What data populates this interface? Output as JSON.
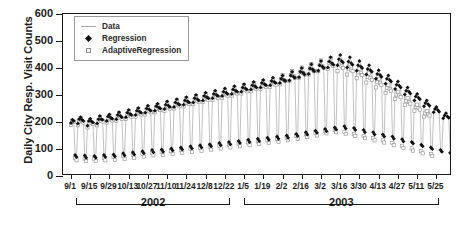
{
  "chart_data": {
    "type": "line",
    "title": "",
    "xlabel": "",
    "ylabel": "Daily City Resp. Visit Counts",
    "ylim": [
      0,
      600
    ],
    "yticks": [
      0,
      100,
      200,
      300,
      400,
      500,
      600
    ],
    "grid": false,
    "legend_position": "top-left",
    "legend": [
      {
        "label": "Data",
        "marker": "line",
        "color": "#a8a8a8"
      },
      {
        "label": "Regression",
        "marker": "filled-diamond",
        "color": "#111111"
      },
      {
        "label": "AdaptiveRegression",
        "marker": "open-square",
        "color": "#8d8d8d"
      }
    ],
    "xticklabels": [
      "9/1",
      "9/15",
      "9/29",
      "10/13",
      "10/27",
      "11/10",
      "11/24",
      "12/8",
      "12/22",
      "1/5",
      "1/19",
      "2/2",
      "2/16",
      "3/2",
      "3/16",
      "3/30",
      "4/13",
      "4/27",
      "5/11",
      "5/25"
    ],
    "xtick_interval_days": 14,
    "x_start": "9/1",
    "x_end": "6/1",
    "n_days": 274,
    "year_groups": [
      {
        "label": "2002",
        "start_index": 0,
        "end_index": 121
      },
      {
        "label": "2003",
        "start_index": 122,
        "end_index": 273
      }
    ],
    "series": [
      {
        "name": "Data",
        "values": [
          198,
          212,
          206,
          76,
          64,
          196,
          214,
          222,
          210,
          208,
          70,
          62,
          188,
          206,
          216,
          204,
          202,
          72,
          66,
          196,
          214,
          226,
          214,
          212,
          76,
          68,
          206,
          224,
          232,
          220,
          216,
          80,
          70,
          212,
          230,
          240,
          226,
          222,
          84,
          74,
          220,
          238,
          248,
          234,
          230,
          88,
          78,
          228,
          246,
          256,
          242,
          238,
          92,
          82,
          236,
          254,
          264,
          250,
          246,
          96,
          86,
          244,
          262,
          272,
          258,
          254,
          100,
          88,
          250,
          268,
          280,
          264,
          260,
          104,
          92,
          258,
          276,
          288,
          272,
          268,
          108,
          96,
          266,
          284,
          296,
          280,
          276,
          112,
          100,
          274,
          292,
          304,
          288,
          284,
          116,
          104,
          282,
          300,
          312,
          296,
          292,
          120,
          108,
          290,
          308,
          320,
          304,
          300,
          124,
          112,
          298,
          316,
          328,
          312,
          308,
          128,
          116,
          306,
          324,
          336,
          320,
          316,
          132,
          120,
          314,
          332,
          344,
          328,
          324,
          136,
          124,
          322,
          340,
          352,
          336,
          332,
          140,
          128,
          330,
          348,
          360,
          344,
          340,
          144,
          132,
          338,
          356,
          368,
          352,
          348,
          148,
          136,
          346,
          364,
          376,
          360,
          356,
          152,
          140,
          356,
          376,
          390,
          372,
          368,
          158,
          146,
          368,
          390,
          404,
          386,
          380,
          164,
          152,
          380,
          402,
          418,
          398,
          392,
          170,
          158,
          392,
          414,
          430,
          410,
          404,
          176,
          164,
          404,
          428,
          444,
          422,
          416,
          182,
          170,
          412,
          436,
          452,
          430,
          424,
          186,
          174,
          404,
          428,
          444,
          422,
          416,
          180,
          168,
          392,
          414,
          430,
          410,
          404,
          172,
          160,
          378,
          400,
          414,
          396,
          390,
          164,
          152,
          362,
          382,
          396,
          378,
          372,
          156,
          144,
          344,
          364,
          376,
          360,
          354,
          148,
          136,
          324,
          342,
          354,
          338,
          332,
          138,
          126,
          304,
          320,
          332,
          316,
          310,
          128,
          118,
          282,
          298,
          308,
          294,
          288,
          118,
          108,
          260,
          274,
          284,
          270,
          264,
          108,
          98,
          238,
          252,
          260,
          248,
          242,
          98,
          88,
          216,
          228,
          236,
          224,
          220,
          88,
          78
        ]
      },
      {
        "name": "Regression",
        "values": [
          196,
          208,
          204,
          78,
          70,
          194,
          210,
          218,
          208,
          204,
          76,
          68,
          186,
          204,
          212,
          202,
          198,
          74,
          68,
          194,
          210,
          222,
          210,
          208,
          78,
          70,
          204,
          220,
          228,
          216,
          212,
          80,
          72,
          210,
          226,
          236,
          222,
          218,
          84,
          76,
          218,
          234,
          244,
          230,
          226,
          88,
          80,
          226,
          242,
          252,
          238,
          234,
          92,
          84,
          234,
          250,
          260,
          246,
          242,
          96,
          88,
          242,
          258,
          268,
          254,
          250,
          98,
          90,
          248,
          264,
          276,
          260,
          256,
          102,
          94,
          256,
          272,
          284,
          268,
          264,
          106,
          98,
          264,
          280,
          292,
          276,
          272,
          110,
          102,
          272,
          288,
          300,
          284,
          280,
          114,
          106,
          280,
          296,
          308,
          292,
          288,
          118,
          110,
          288,
          304,
          316,
          300,
          296,
          122,
          114,
          296,
          312,
          324,
          308,
          304,
          126,
          118,
          304,
          320,
          332,
          316,
          312,
          130,
          122,
          312,
          328,
          340,
          324,
          320,
          134,
          126,
          320,
          336,
          348,
          332,
          328,
          138,
          130,
          328,
          344,
          356,
          340,
          336,
          142,
          134,
          336,
          352,
          364,
          348,
          344,
          146,
          138,
          344,
          360,
          372,
          356,
          352,
          150,
          142,
          354,
          372,
          386,
          368,
          364,
          156,
          148,
          366,
          386,
          400,
          382,
          376,
          162,
          154,
          378,
          398,
          414,
          394,
          388,
          168,
          160,
          390,
          410,
          426,
          406,
          400,
          174,
          166,
          402,
          424,
          440,
          418,
          412,
          180,
          172,
          410,
          432,
          448,
          426,
          420,
          184,
          176,
          402,
          424,
          440,
          418,
          412,
          178,
          170,
          390,
          410,
          426,
          406,
          400,
          170,
          162,
          376,
          396,
          410,
          392,
          386,
          162,
          154,
          360,
          378,
          392,
          374,
          368,
          154,
          146,
          342,
          360,
          372,
          356,
          350,
          146,
          138,
          322,
          338,
          350,
          334,
          328,
          136,
          128,
          302,
          316,
          328,
          312,
          306,
          126,
          120,
          280,
          294,
          304,
          290,
          284,
          116,
          110,
          258,
          270,
          280,
          266,
          260,
          106,
          100,
          236,
          248,
          256,
          244,
          238,
          96,
          90,
          214,
          224,
          232,
          220,
          216,
          86,
          80
        ]
      },
      {
        "name": "AdaptiveRegression",
        "values": [
          190,
          204,
          200,
          66,
          58,
          188,
          206,
          214,
          202,
          198,
          64,
          56,
          180,
          198,
          208,
          196,
          192,
          62,
          56,
          188,
          206,
          218,
          204,
          202,
          66,
          58,
          198,
          216,
          224,
          210,
          206,
          70,
          60,
          204,
          222,
          232,
          216,
          212,
          74,
          64,
          212,
          230,
          240,
          224,
          220,
          78,
          68,
          220,
          238,
          248,
          232,
          228,
          82,
          72,
          228,
          246,
          256,
          240,
          236,
          86,
          76,
          236,
          254,
          264,
          248,
          244,
          88,
          78,
          242,
          260,
          272,
          254,
          250,
          92,
          82,
          250,
          268,
          280,
          262,
          258,
          96,
          86,
          258,
          276,
          288,
          270,
          266,
          100,
          90,
          266,
          284,
          296,
          278,
          274,
          104,
          94,
          274,
          292,
          304,
          286,
          282,
          108,
          98,
          282,
          300,
          312,
          294,
          290,
          112,
          102,
          290,
          308,
          320,
          302,
          298,
          116,
          106,
          298,
          316,
          328,
          310,
          306,
          120,
          110,
          306,
          324,
          336,
          318,
          314,
          124,
          114,
          314,
          332,
          344,
          326,
          322,
          128,
          118,
          322,
          340,
          352,
          334,
          330,
          132,
          122,
          330,
          348,
          360,
          342,
          338,
          136,
          126,
          340,
          360,
          374,
          356,
          352,
          142,
          132,
          352,
          374,
          388,
          370,
          364,
          148,
          138,
          364,
          386,
          402,
          382,
          376,
          154,
          144,
          376,
          398,
          414,
          394,
          388,
          160,
          150,
          388,
          412,
          428,
          406,
          400,
          166,
          158,
          396,
          420,
          436,
          414,
          408,
          170,
          162,
          388,
          412,
          428,
          406,
          400,
          164,
          156,
          376,
          398,
          414,
          394,
          388,
          156,
          148,
          362,
          384,
          398,
          380,
          374,
          148,
          140,
          346,
          366,
          380,
          362,
          356,
          140,
          132,
          328,
          348,
          360,
          344,
          338,
          132,
          124,
          308,
          326,
          338,
          322,
          316,
          122,
          114,
          286,
          302,
          312,
          298,
          292,
          112,
          104,
          264,
          278,
          288,
          274,
          268,
          102,
          94,
          242,
          256,
          264,
          252,
          246,
          92,
          84,
          220,
          232,
          240,
          228,
          224,
          82,
          74
        ]
      }
    ]
  }
}
